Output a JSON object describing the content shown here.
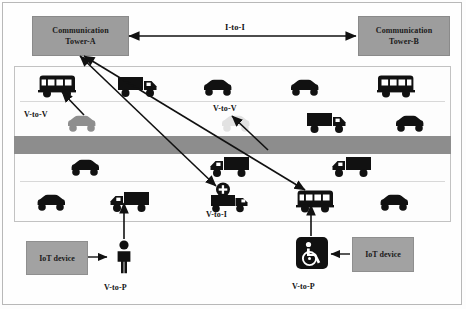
{
  "diagram": {
    "colors": {
      "box_fill": "#9d9d9d",
      "vehicle_dark": "#111111",
      "vehicle_gray": "#8e8e8e",
      "vehicle_faint": "#e2e2e2",
      "median": "#8d8d8d",
      "frame": "#c2c2c2"
    }
  },
  "towers": {
    "a": {
      "line1": "Communication",
      "line2": "Tower-A"
    },
    "b": {
      "line1": "Communication",
      "line2": "Tower-B"
    }
  },
  "iot_devices": {
    "left": "IoT device",
    "right": "IoT device"
  },
  "labels": {
    "i2i": "I-to-I",
    "v2v_left": "V-to-V",
    "v2v_mid": "V-to-V",
    "v2v_right": "V-to-V",
    "v2i": "V-to-I",
    "v2p_left": "V-to-P",
    "v2p_right": "V-to-P"
  },
  "links": [
    {
      "name": "tower-a-to-tower-b",
      "label": "I-to-I",
      "kind": "bidirectional"
    },
    {
      "name": "tower-a-to-ambulance",
      "label": "V-to-I",
      "kind": "bidirectional"
    },
    {
      "name": "tower-a-to-bus",
      "label": "V-to-I",
      "kind": "bidirectional"
    },
    {
      "name": "gray-car-to-bus",
      "label": "V-to-V",
      "kind": "unidirectional"
    },
    {
      "name": "faint-car-to-midpoint",
      "label": "V-to-V",
      "kind": "unidirectional"
    },
    {
      "name": "pedestrian-to-truck",
      "label": "V-to-P",
      "kind": "unidirectional"
    },
    {
      "name": "wheelchair-to-bus",
      "label": "V-to-P",
      "kind": "unidirectional"
    },
    {
      "name": "iot-left-to-pedestrian",
      "label": "IoT device",
      "kind": "unidirectional"
    },
    {
      "name": "iot-right-to-wheelchair",
      "label": "IoT device",
      "kind": "unidirectional"
    }
  ],
  "lanes": [
    {
      "name": "lane-1-eastbound-outer",
      "direction": "east",
      "vehicles": [
        {
          "type": "bus",
          "icon": "bus-icon",
          "facing": "left",
          "shade": "dark",
          "x": 36,
          "y": 74
        },
        {
          "type": "truck",
          "icon": "truck-icon",
          "facing": "right",
          "shade": "dark",
          "x": 117,
          "y": 74
        },
        {
          "type": "car",
          "icon": "car-icon",
          "facing": "right",
          "shade": "dark",
          "x": 198,
          "y": 77
        },
        {
          "type": "car",
          "icon": "car-icon",
          "facing": "right",
          "shade": "dark",
          "x": 285,
          "y": 77
        },
        {
          "type": "bus",
          "icon": "bus-icon",
          "facing": "right",
          "shade": "dark",
          "x": 375,
          "y": 74
        }
      ]
    },
    {
      "name": "lane-2-eastbound-inner",
      "direction": "east",
      "vehicles": [
        {
          "type": "car",
          "icon": "car-icon",
          "facing": "right",
          "shade": "gray",
          "x": 62,
          "y": 113
        },
        {
          "type": "car",
          "icon": "car-icon",
          "facing": "right",
          "shade": "faint",
          "x": 216,
          "y": 113
        },
        {
          "type": "truck",
          "icon": "truck-icon",
          "facing": "right",
          "shade": "dark",
          "x": 306,
          "y": 110
        },
        {
          "type": "car",
          "icon": "car-icon",
          "facing": "right",
          "shade": "dark",
          "x": 390,
          "y": 113
        }
      ]
    },
    {
      "name": "lane-3-westbound-inner",
      "direction": "west",
      "vehicles": [
        {
          "type": "car",
          "icon": "car-icon",
          "facing": "left",
          "shade": "dark",
          "x": 65,
          "y": 157
        },
        {
          "type": "truck",
          "icon": "truck-icon",
          "facing": "left",
          "shade": "dark",
          "x": 206,
          "y": 154
        },
        {
          "type": "truck",
          "icon": "truck-icon",
          "facing": "left",
          "shade": "dark",
          "x": 328,
          "y": 154
        }
      ]
    },
    {
      "name": "lane-4-westbound-outer",
      "direction": "west",
      "vehicles": [
        {
          "type": "car",
          "icon": "car-icon",
          "facing": "left",
          "shade": "dark",
          "x": 31,
          "y": 192
        },
        {
          "type": "truck",
          "icon": "truck-icon",
          "facing": "left",
          "shade": "dark",
          "x": 106,
          "y": 189
        },
        {
          "type": "ambulance",
          "icon": "ambulance-icon",
          "facing": "left",
          "shade": "dark",
          "x": 205,
          "y": 182
        },
        {
          "type": "bus",
          "icon": "bus-icon",
          "facing": "left",
          "shade": "dark",
          "x": 294,
          "y": 189
        },
        {
          "type": "car",
          "icon": "car-icon",
          "facing": "left",
          "shade": "dark",
          "x": 374,
          "y": 192
        }
      ]
    }
  ],
  "actors": [
    {
      "name": "pedestrian",
      "icon": "pedestrian-icon",
      "label": "V-to-P",
      "x": 111,
      "y": 241
    },
    {
      "name": "wheelchair",
      "icon": "wheelchair-icon",
      "label": "V-to-P",
      "x": 298,
      "y": 240
    }
  ]
}
